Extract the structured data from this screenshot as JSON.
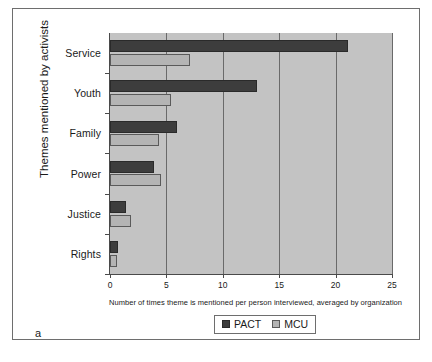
{
  "figure": {
    "panel_label": "a"
  },
  "chart_data": {
    "type": "bar",
    "orientation": "horizontal",
    "title": "",
    "xlabel": "Number of times theme is mentioned per person interviewed, averaged by organization",
    "ylabel": "Themes mentioned by activists",
    "categories": [
      "Service",
      "Youth",
      "Family",
      "Power",
      "Justice",
      "Rights"
    ],
    "series": [
      {
        "name": "PACT",
        "color": "#3d3d3d",
        "values": [
          21.1,
          13.0,
          5.9,
          3.9,
          1.4,
          0.7
        ]
      },
      {
        "name": "MCU",
        "color": "#b4b4b4",
        "values": [
          7.1,
          5.4,
          4.3,
          4.5,
          1.9,
          0.6
        ]
      }
    ],
    "xlim": [
      0,
      25
    ],
    "xticks": [
      0,
      5,
      10,
      15,
      20,
      25
    ],
    "xtick_labels": [
      "0",
      "5",
      "10",
      "15",
      "20",
      "25"
    ],
    "grid": "vertical",
    "legend_position": "bottom-center",
    "plot_background": "#c3c3c3"
  }
}
